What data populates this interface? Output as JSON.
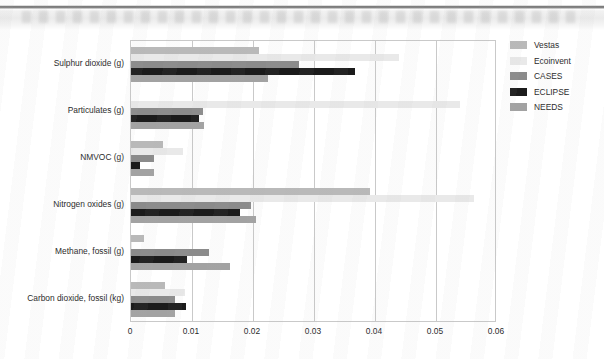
{
  "header": {
    "band_label": "scanned-page-header-band"
  },
  "legend": {
    "position": "right",
    "items": [
      {
        "label": "Vestas",
        "color": "#b9b9b9"
      },
      {
        "label": "Ecoinvent",
        "color": "#e9e9e9"
      },
      {
        "label": "CASES",
        "color": "#8b8b8b"
      },
      {
        "label": "ECLIPSE",
        "color": "#1b1b1b"
      },
      {
        "label": "NEEDS",
        "color": "#a2a2a2"
      }
    ]
  },
  "chart_data": {
    "type": "bar",
    "orientation": "horizontal",
    "title": "",
    "subtitle": "",
    "xlabel": "",
    "ylabel": "",
    "xlim": [
      0,
      0.06
    ],
    "xticks": [
      "0",
      "0.01",
      "0.02",
      "0.03",
      "0.04",
      "0.05",
      "0.06"
    ],
    "xtick_values": [
      0,
      0.01,
      0.02,
      0.03,
      0.04,
      0.05,
      0.06
    ],
    "grid": true,
    "grid_axis": "x",
    "legend_position": "right",
    "categories": [
      "Sulphur dioxide (g)",
      "Particulates (g)",
      "NMVOC (g)",
      "Nitrogen oxides (g)",
      "Methane, fossil (g)",
      "Carbon dioxide, fossil (kg)"
    ],
    "series": [
      {
        "name": "Vestas",
        "color": "#b9b9b9",
        "values": [
          0.021,
          0.0,
          0.0053,
          0.0392,
          0.0022,
          0.0055
        ]
      },
      {
        "name": "Ecoinvent",
        "color": "#e9e9e9",
        "values": [
          0.044,
          0.054,
          0.0085,
          0.0562,
          0.0002,
          0.0088
        ]
      },
      {
        "name": "CASES",
        "color": "#8b8b8b",
        "values": [
          0.0275,
          0.0118,
          0.0037,
          0.0197,
          0.0128,
          0.0072
        ]
      },
      {
        "name": "ECLIPSE",
        "color": "#1b1b1b",
        "values": [
          0.0367,
          0.0112,
          0.0015,
          0.0178,
          0.0092,
          0.009
        ]
      },
      {
        "name": "NEEDS",
        "color": "#a2a2a2",
        "values": [
          0.0225,
          0.012,
          0.0037,
          0.0205,
          0.0163,
          0.0072
        ]
      }
    ]
  }
}
